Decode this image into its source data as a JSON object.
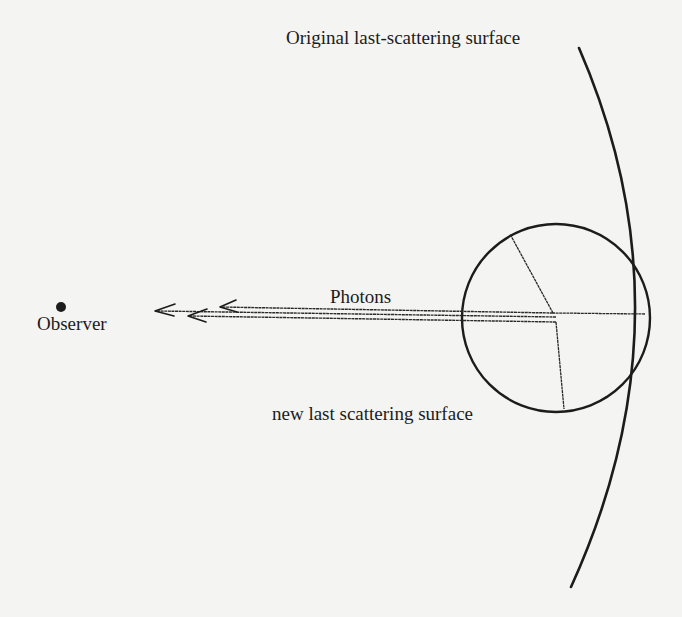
{
  "figure": {
    "labels": {
      "original_surface": "Original last-scattering surface",
      "photons": "Photons",
      "observer": "Observer",
      "new_surface": "new last scattering surface"
    },
    "colors": {
      "background": "#f4f4f2",
      "ink": "#1c1c1c"
    },
    "elements": {
      "observer_point": "observer-dot",
      "original_surface": "large-arc",
      "new_surface": "circle",
      "photon_paths": "three-parallel-arrows"
    }
  }
}
